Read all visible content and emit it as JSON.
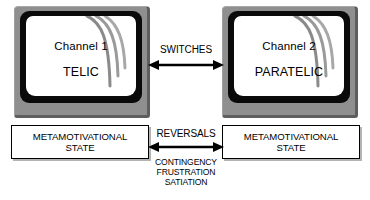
{
  "diagram": {
    "units": [
      {
        "id": "left",
        "screen_channel": "Channel 1",
        "screen_mode": "TELIC",
        "state_line1": "METAMOTIVATIONAL",
        "state_line2": "STATE"
      },
      {
        "id": "right",
        "screen_channel": "Channel 2",
        "screen_mode": "PARATELIC",
        "state_line1": "METAMOTIVATIONAL",
        "state_line2": "STATE"
      }
    ],
    "connectors": {
      "top_label": "SWITCHES",
      "bottom_label": "REVERSALS",
      "bottom_causes": [
        "CONTINGENCY",
        "FRUSTRATION",
        "SATIATION"
      ],
      "top_arrow_icon": "double-headed-arrow-icon",
      "bottom_arrow_icon": "double-headed-arrow-icon"
    },
    "colors": {
      "bezel": "#8f8f8f",
      "bezel_shadow": "#5e5e5e",
      "frame": "#0a0a0a",
      "screen": "#ffffff",
      "ink": "#000000",
      "box_shadow": "#b4b4b4",
      "background": "#ffffff"
    }
  }
}
